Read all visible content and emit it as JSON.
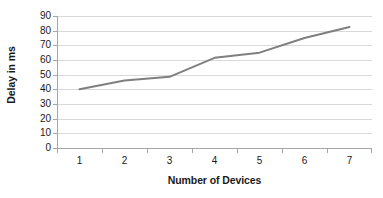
{
  "chart_data": {
    "type": "line",
    "title": "",
    "subtitle": "",
    "xlabel": "Number of Devices",
    "ylabel": "Delay in ms",
    "categories": [
      "1",
      "2",
      "3",
      "4",
      "5",
      "6",
      "7"
    ],
    "x": [
      1,
      2,
      3,
      4,
      5,
      6,
      7
    ],
    "values": [
      40,
      46,
      48.5,
      61.5,
      65,
      75,
      82.5
    ],
    "series": [
      {
        "name": "Delay",
        "values": [
          40,
          46,
          48.5,
          61.5,
          65,
          75,
          82.5
        ],
        "color": "#7f7f7f"
      }
    ],
    "ylim": [
      0,
      90
    ],
    "ytick_step": 10,
    "ytick_labels": [
      "0",
      "10",
      "20",
      "30",
      "40",
      "50",
      "60",
      "70",
      "80",
      "90"
    ],
    "grid": {
      "horizontal": true,
      "vertical": false,
      "color": "#d9d9d9"
    },
    "legend": {
      "visible": false,
      "position": "none"
    },
    "markers": false,
    "line_width": 2,
    "colors": {
      "line": "#7f7f7f",
      "gridline": "#d9d9d9",
      "axis": "#a6a6a6",
      "text": "#1a1a1a",
      "background": "#ffffff"
    }
  }
}
